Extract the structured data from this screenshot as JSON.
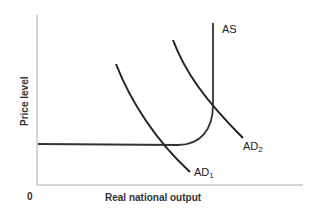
{
  "diagram": {
    "type": "economics-ad-as",
    "x_axis_label": "Real national output",
    "y_axis_label": "Price level",
    "origin_label": "0",
    "curves": [
      {
        "name": "AS",
        "label": "AS",
        "sub": ""
      },
      {
        "name": "AD1",
        "label": "AD",
        "sub": "1"
      },
      {
        "name": "AD2",
        "label": "AD",
        "sub": "2"
      }
    ],
    "colors": {
      "line": "#222222",
      "axis": "#999999",
      "background": "#ffffff"
    }
  }
}
